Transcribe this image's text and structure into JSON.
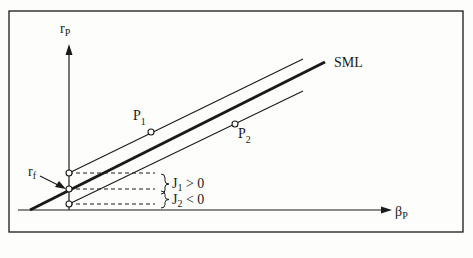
{
  "diagram": {
    "type": "security-market-line",
    "y_axis_label": "r",
    "y_axis_sub": "P",
    "x_axis_label": "β",
    "x_axis_sub": "P",
    "sml_label": "SML",
    "rf_label": "r",
    "rf_sub": "f",
    "portfolios": [
      {
        "label": "P",
        "sub": "1"
      },
      {
        "label": "P",
        "sub": "2"
      }
    ],
    "jensen": [
      {
        "label": "J",
        "sub": "1",
        "rel": " > 0"
      },
      {
        "label": "J",
        "sub": "2",
        "rel": " < 0"
      }
    ],
    "colors": {
      "ink": "#1a1a1a",
      "background": "#fdfdfb"
    }
  }
}
